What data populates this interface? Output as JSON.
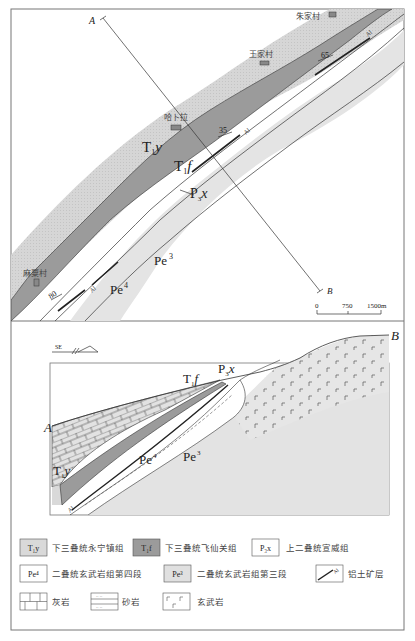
{
  "map": {
    "profile_line": {
      "start_label": "A",
      "end_label": "B"
    },
    "villages": [
      {
        "name": "朱家村"
      },
      {
        "name": "王家村"
      },
      {
        "name": "哈卜拉"
      },
      {
        "name": "麻粟村"
      }
    ],
    "unit_labels": {
      "t1y_main": "T",
      "t1y_sub": "1",
      "t1y_letter": "y",
      "t1f_main": "T",
      "t1f_sub": "1",
      "t1f_letter": "f",
      "p3x_main": "P",
      "p3x_sub": "3",
      "p3x_letter": "x",
      "pe3_main": "Pe",
      "pe3_sup": "3",
      "pe4_main": "Pe",
      "pe4_sup": "4"
    },
    "dips": [
      "65",
      "35",
      "80"
    ],
    "al_labels": [
      "Al",
      "Al",
      "Al"
    ],
    "scale_bar": {
      "ticks": [
        "0",
        "750",
        "1500m"
      ]
    }
  },
  "section": {
    "orientation": "SE",
    "ends": {
      "left": "A",
      "right": "B"
    },
    "labels": {
      "t1f": "T",
      "t1f_sub": "1",
      "t1f_letter": "f",
      "p3x": "P",
      "p3x_sub": "3",
      "p3x_letter": "x",
      "t1y": "T",
      "t1y_sub": "1",
      "t1y_letter": "y",
      "pe4": "Pe",
      "pe4_sup": "4",
      "pe3": "Pe",
      "pe3_sup": "3",
      "al": "Al"
    }
  },
  "legend": {
    "items": [
      {
        "code": "T₁y",
        "label": "下三叠统永宁镇组",
        "fill": "#d8d8d8"
      },
      {
        "code": "T₁f",
        "label": "下三叠统飞仙关组",
        "fill": "#9a9a9a"
      },
      {
        "code": "P₃x",
        "label": "上二叠统宣威组",
        "fill": "#ffffff"
      },
      {
        "code": "Pe⁴",
        "label": "二叠统玄武岩组第四段",
        "fill": "#ffffff"
      },
      {
        "code": "Pe³",
        "label": "二叠统玄武岩组第三段",
        "fill": "#e0e0e0"
      },
      {
        "code": "",
        "label": "铝土矿层",
        "fill": "#ffffff"
      },
      {
        "code": "",
        "label": "灰岩",
        "fill": "#ffffff"
      },
      {
        "code": "",
        "label": "砂岩",
        "fill": "#ffffff"
      },
      {
        "code": "",
        "label": "玄武岩",
        "fill": "#ffffff"
      }
    ]
  },
  "colors": {
    "t1y": "#d9d9d9",
    "t1f": "#9b9b9b",
    "pe3": "#e3e3e3",
    "white": "#ffffff",
    "line": "#333333"
  }
}
